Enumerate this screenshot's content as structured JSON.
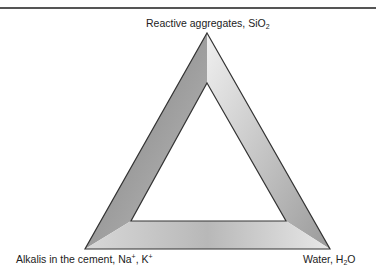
{
  "figure": {
    "type": "triangle-diagram",
    "vertices": {
      "top": {
        "label_main": "Reactive aggregates, SiO",
        "label_sub": "2"
      },
      "bottom_left": {
        "label_main": "Alkalis in the cement, Na",
        "label_sup1": "+",
        "label_mid": ", K",
        "label_sup2": "+"
      },
      "bottom_right": {
        "label_main": "Water, H",
        "label_sub": "2",
        "label_end": "O"
      }
    },
    "colors": {
      "outline": "#333333",
      "face_dark": "#8a8a8a",
      "face_mid": "#b0b0b0",
      "face_light": "#e4e4e4",
      "rule": "#555555"
    }
  }
}
